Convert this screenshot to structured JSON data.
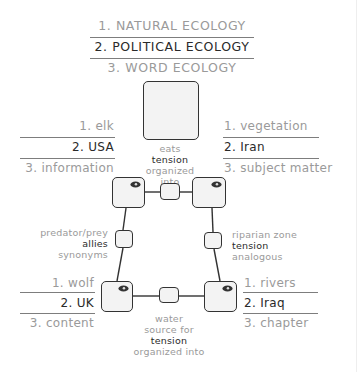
{
  "header": {
    "items": [
      "1. NATURAL ECOLOGY",
      "2. POLITICAL ECOLOGY",
      "3. WORD ECOLOGY"
    ]
  },
  "nodes": {
    "top_left": [
      "1. elk",
      "2. USA",
      "3. information"
    ],
    "top_right": [
      "1. vegetation",
      "2. Iran",
      "3. subject matter"
    ],
    "bottom_left": [
      "1. wolf",
      "2. UK",
      "3. content"
    ],
    "bottom_right": [
      "1. rivers",
      "2. Iraq",
      "3. chapter"
    ]
  },
  "edges": {
    "top": [
      "eats",
      "tension",
      "organized",
      "into"
    ],
    "left": [
      "predator/prey",
      "allies",
      "synonyms"
    ],
    "right": [
      "riparian zone",
      "tension",
      "analogous"
    ],
    "bottom": [
      "water",
      "source for",
      "tension",
      "organized into"
    ]
  },
  "icons": {
    "node_marker": "eye-icon"
  },
  "colors": {
    "muted": "#9a9a9a",
    "dark": "#2a2a2a",
    "node_fill": "#f3f3f3",
    "stroke": "#333333"
  }
}
